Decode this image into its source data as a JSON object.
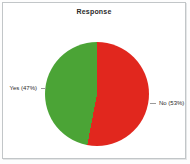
{
  "chart_data": {
    "type": "pie",
    "title": "Response",
    "legend": "none",
    "draw_order": "clockwise-from-top",
    "slices": [
      {
        "name": "No",
        "value": 53,
        "percent_label": "No (53%)",
        "color": "#e1271e",
        "position": "right"
      },
      {
        "name": "Yes",
        "value": 47,
        "percent_label": "Yes (47%)",
        "color": "#4ba436",
        "position": "left"
      }
    ]
  },
  "panel": {
    "background": "#ffffff",
    "border_color": "#c2c6c8"
  }
}
